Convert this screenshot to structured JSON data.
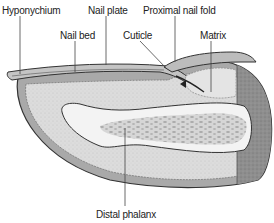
{
  "diagram": {
    "labels": {
      "hyponychium": "Hyponychium",
      "nail_plate": "Nail plate",
      "nail_bed": "Nail bed",
      "cuticle": "Cuticle",
      "proximal_nail_fold": "Proximal nail fold",
      "matrix": "Matrix",
      "distal_phalanx": "Distal phalanx"
    },
    "colors": {
      "skin_outer": "#8c8c8c",
      "dermis_fill": "#d9d9d9",
      "epidermis_band": "#b5b5b5",
      "nail_plate": "#c4c4c4",
      "bone_cortex": "#f2f2f2",
      "bone_marrow": "#bdbdbd",
      "proximal_shade": "#8f8f8f",
      "outline": "#333333",
      "leader_line": "#444444"
    }
  }
}
